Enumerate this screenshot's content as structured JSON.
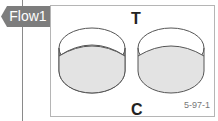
{
  "tab": {
    "label": "Flow1"
  },
  "figure": {
    "top_label": "T",
    "bottom_label": "C",
    "caption": "5-97-1",
    "items": [
      {
        "name": "left-ring",
        "shape": "cylinder-band"
      },
      {
        "name": "right-ring",
        "shape": "cylinder-band"
      }
    ],
    "colors": {
      "tab_bg": "#7d7d7d",
      "band_fill": "#e3e3e3",
      "stroke": "#555555",
      "frame": "#b5b5b5"
    }
  }
}
